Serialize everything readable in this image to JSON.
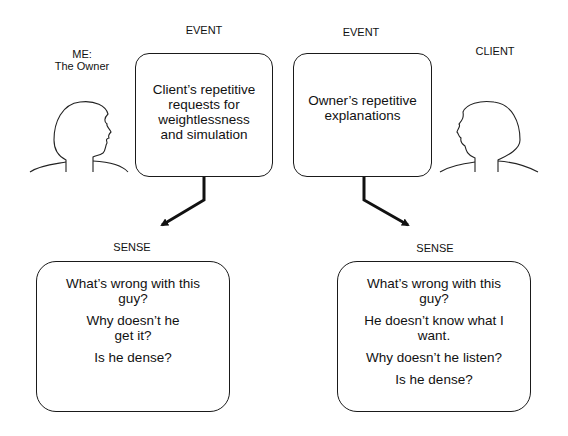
{
  "left_person": {
    "label_line1": "ME:",
    "label_line2": "The Owner"
  },
  "right_person": {
    "label": "CLIENT"
  },
  "event_left": {
    "heading": "EVENT",
    "text_lines": [
      "Client’s repetitive",
      "requests for",
      "weightlessness",
      "and simulation"
    ]
  },
  "event_right": {
    "heading": "EVENT",
    "text_lines": [
      "Owner’s repetitive",
      "explanations"
    ]
  },
  "sense_left": {
    "heading": "SENSE",
    "items": [
      "What’s wrong with this guy?",
      "Why doesn’t he get it?",
      "Is he dense?"
    ]
  },
  "sense_right": {
    "heading": "SENSE",
    "items": [
      "What’s wrong with this guy?",
      "He doesn’t know what I want.",
      "Why doesn’t he listen?",
      "Is he dense?"
    ]
  }
}
